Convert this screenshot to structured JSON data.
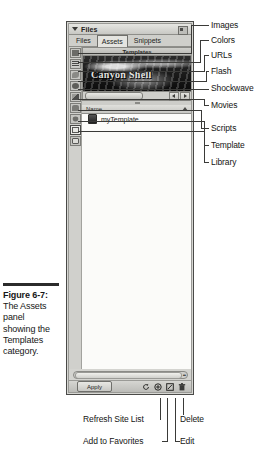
{
  "figure": {
    "caption_lines": [
      "Figure 6-7:",
      "The Assets",
      "panel",
      "showing the",
      "Templates",
      "category."
    ]
  },
  "panel": {
    "title": "Files",
    "options_icon": "panel-options-icon",
    "collapse_icon": "triangle-down-icon",
    "tabs": [
      {
        "label": "Files",
        "active": false
      },
      {
        "label": "Assets",
        "active": true
      },
      {
        "label": "Snippets",
        "active": false
      }
    ],
    "category_header": "Templates",
    "categories": [
      {
        "name": "images",
        "icon": "images-icon"
      },
      {
        "name": "colors",
        "icon": "colors-icon"
      },
      {
        "name": "urls",
        "icon": "urls-icon"
      },
      {
        "name": "flash",
        "icon": "flash-icon"
      },
      {
        "name": "shockwave",
        "icon": "shockwave-icon"
      },
      {
        "name": "movies",
        "icon": "movies-icon"
      },
      {
        "name": "scripts",
        "icon": "scripts-icon"
      },
      {
        "name": "template",
        "icon": "template-icon"
      },
      {
        "name": "library",
        "icon": "library-icon"
      }
    ],
    "preview": {
      "banner_text": "Canyon Shell"
    },
    "list": {
      "column_header": "Name",
      "rows": [
        {
          "name": "myTemplate",
          "icon": "template-file-icon"
        }
      ]
    },
    "toolbar": {
      "apply_label": "Apply",
      "buttons": [
        {
          "name": "refresh-site-list",
          "icon": "refresh-icon"
        },
        {
          "name": "add-to-favorites",
          "icon": "add-favorites-icon"
        },
        {
          "name": "edit",
          "icon": "edit-icon"
        },
        {
          "name": "delete",
          "icon": "trash-icon"
        }
      ]
    }
  },
  "callouts": {
    "right": [
      {
        "label": "Images"
      },
      {
        "label": "Colors"
      },
      {
        "label": "URLs"
      },
      {
        "label": "Flash"
      },
      {
        "label": "Shockwave"
      },
      {
        "label": "Movies"
      },
      {
        "label": "Scripts"
      },
      {
        "label": "Template"
      },
      {
        "label": "Library"
      }
    ],
    "bottom": [
      {
        "label": "Refresh Site List"
      },
      {
        "label": "Add to Favorites"
      },
      {
        "label": "Delete"
      },
      {
        "label": "Edit"
      }
    ]
  }
}
